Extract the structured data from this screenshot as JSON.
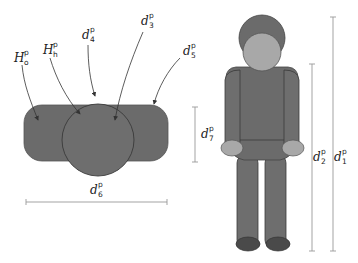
{
  "colors": {
    "body_dark": "#6b6b6b",
    "body_mid": "#7a7a7a",
    "head_light": "#a8a8a8",
    "shoe": "#4a4a4a",
    "outline": "#3a3a3a",
    "dim_line": "#999999",
    "arrow": "#333333"
  },
  "top_view": {
    "labels": [
      {
        "id": "H_o",
        "main": "H",
        "sup": "p",
        "sub": "o"
      },
      {
        "id": "H_h",
        "main": "H",
        "sup": "p",
        "sub": "h"
      },
      {
        "id": "d_4",
        "main": "d",
        "sup": "p",
        "sub": "4"
      },
      {
        "id": "d_3",
        "main": "d",
        "sup": "p",
        "sub": "3"
      },
      {
        "id": "d_5",
        "main": "d",
        "sup": "p",
        "sub": "5"
      },
      {
        "id": "d_6",
        "main": "d",
        "sup": "p",
        "sub": "6"
      },
      {
        "id": "d_7",
        "main": "d",
        "sup": "p",
        "sub": "7"
      }
    ]
  },
  "front_view": {
    "labels": [
      {
        "id": "d_2",
        "main": "d",
        "sup": "p",
        "sub": "2"
      },
      {
        "id": "d_1",
        "main": "d",
        "sup": "p",
        "sub": "1"
      }
    ]
  }
}
